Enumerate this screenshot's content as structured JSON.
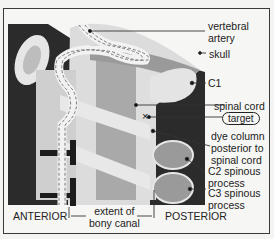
{
  "figure": {
    "type": "annotated radiograph diagram",
    "colors": {
      "dark": "#2b2b2b",
      "mid": "#8c8c8c",
      "light": "#d4d4d4",
      "bone": "#e2e2e2",
      "background": "#f6f6f4"
    },
    "labels": {
      "vertebral_artery": [
        "vertebral",
        "artery"
      ],
      "skull": "skull",
      "c1": "C1",
      "spinal_cord": "spinal cord",
      "target": "target",
      "dye_column": [
        "dye column",
        "posterior to",
        "spinal cord"
      ],
      "c2_spinous": [
        "C2 spinous",
        "process"
      ],
      "c3_spinous": [
        "C3 spinous",
        "process"
      ],
      "anterior": "ANTERIOR",
      "extent": [
        "extent of",
        "bony canal"
      ],
      "posterior": "POSTERIOR"
    },
    "markers": {
      "target_symbol": "×"
    }
  }
}
